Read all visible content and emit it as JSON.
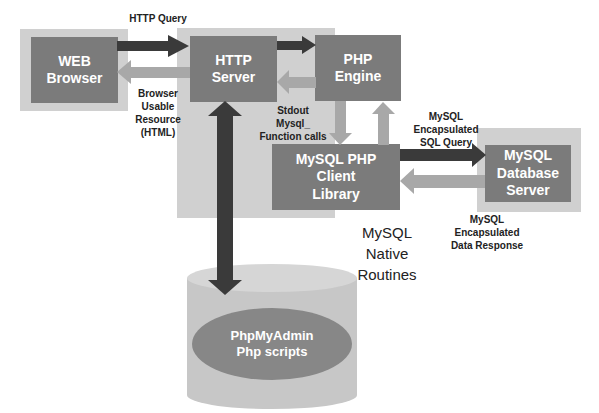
{
  "diagram": {
    "title": "",
    "nodes": {
      "web_browser": "WEB\nBrowser",
      "http_server": "HTTP\nServer",
      "php_engine": "PHP\nEngine",
      "mysql_php_client": "MySQL PHP\nClient\nLibrary",
      "mysql_db_server": "MySQL\nDatabase\nServer",
      "phpmyadmin": "PhpMyAdmin\nPhp scripts"
    },
    "edges": [
      {
        "from": "web_browser",
        "to": "http_server",
        "label": "HTTP Query"
      },
      {
        "from": "http_server",
        "to": "web_browser",
        "label": "Browser\nUsable\nResource\n(HTML)"
      },
      {
        "from": "http_server",
        "to": "php_engine",
        "label": ""
      },
      {
        "from": "php_engine",
        "to": "http_server",
        "label": "Stdout\nMysql_\nFunction calls"
      },
      {
        "from": "php_engine",
        "to": "mysql_php_client",
        "label": ""
      },
      {
        "from": "mysql_php_client",
        "to": "php_engine",
        "label": ""
      },
      {
        "from": "mysql_php_client",
        "to": "mysql_db_server",
        "label": "MySQL\nEncapsulated\nSQL Query"
      },
      {
        "from": "mysql_db_server",
        "to": "mysql_php_client",
        "label": "MySQL\nEncapsulated\nData Response"
      },
      {
        "from": "http_server",
        "to": "phpmyadmin",
        "label": "",
        "bidirectional": true
      }
    ],
    "region_label": "MySQL\nNative\nRoutines"
  },
  "colors": {
    "panel": "#d0d0d0",
    "box": "#7b7b7b",
    "dark_arrow": "#3a3a3a",
    "light_arrow": "#a8a8a8"
  }
}
